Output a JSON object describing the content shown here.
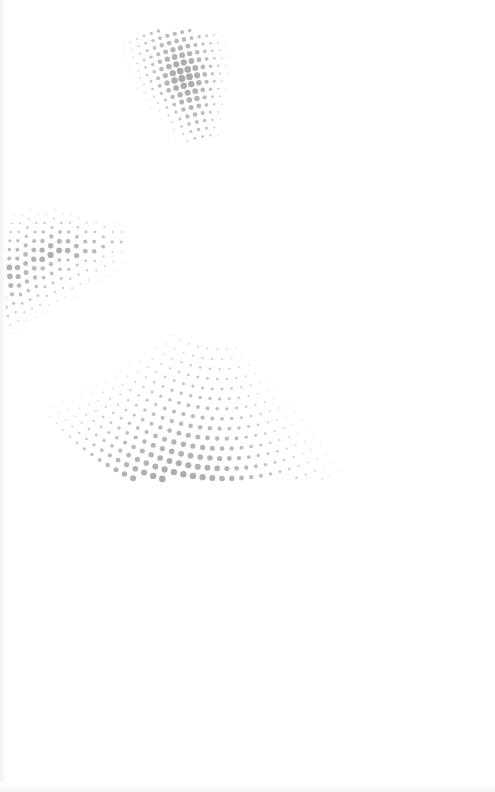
{
  "artwork": {
    "description": "Halftone dot spiral / swirl graphic",
    "background_color": "#ffffff",
    "dot_color": "#a8a8a8",
    "center": {
      "x": 222,
      "y": 232
    },
    "rings": 16,
    "inner_radius": 95,
    "ring_spacing": 9,
    "max_dot_radius": 3.6,
    "dot_spacing": 8.5
  }
}
